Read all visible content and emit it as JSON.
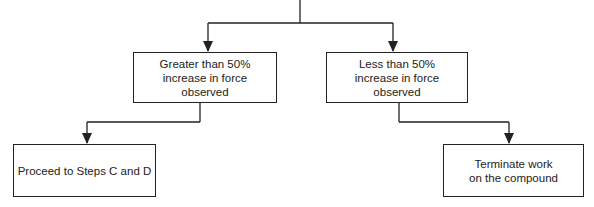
{
  "diagram": {
    "type": "flowchart",
    "line_color": "#222222",
    "nodes": [
      {
        "id": "greater",
        "label": "Greater than 50%\nincrease in force\nobserved"
      },
      {
        "id": "less",
        "label": "Less  than 50%\nincrease in force\nobserved"
      },
      {
        "id": "proceed",
        "label": "Proceed to Steps C and D"
      },
      {
        "id": "terminate",
        "label": "Terminate work\non the compound"
      }
    ],
    "edges": [
      {
        "from": "top",
        "to": "greater"
      },
      {
        "from": "top",
        "to": "less"
      },
      {
        "from": "greater",
        "to": "proceed"
      },
      {
        "from": "less",
        "to": "terminate"
      }
    ]
  }
}
